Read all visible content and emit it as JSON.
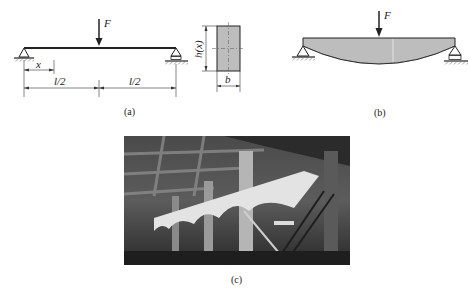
{
  "panel_a": {
    "force_label": "F",
    "x_label": "x",
    "half_span_left": "l/2",
    "half_span_right": "l/2",
    "height_label": "h(x)",
    "width_label": "b",
    "caption": "(a)"
  },
  "panel_b": {
    "force_label": "F",
    "caption": "(b)"
  },
  "panel_c": {
    "description": "Photograph of a fish-belly shaped concrete beam structure inside an industrial building",
    "caption": "(c)"
  },
  "colors": {
    "line": "#222222",
    "fill": "#bdbdbd",
    "photo_dark": "#2e2e2e",
    "photo_light": "#d8d8d8"
  }
}
